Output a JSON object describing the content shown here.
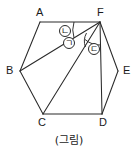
{
  "figure": {
    "caption": "(그림)",
    "shape_name": "hexagon-ABCDEF",
    "stroke_color": "#2a2a2a",
    "background_color": "#ffffff",
    "vertices": [
      {
        "label": "A",
        "x": 40,
        "y": 22,
        "label_x": 36,
        "label_y": 7
      },
      {
        "label": "B",
        "x": 20,
        "y": 71,
        "label_x": 6,
        "label_y": 65
      },
      {
        "label": "C",
        "x": 43,
        "y": 114,
        "label_x": 38,
        "label_y": 117
      },
      {
        "label": "D",
        "x": 102,
        "y": 114,
        "label_x": 99,
        "label_y": 117
      },
      {
        "label": "E",
        "x": 118,
        "y": 71,
        "label_x": 123,
        "label_y": 65
      },
      {
        "label": "F",
        "x": 100,
        "y": 22,
        "label_x": 97,
        "label_y": 7
      }
    ],
    "edges": [
      {
        "name": "edge-AF",
        "from": "A",
        "to": "F"
      },
      {
        "name": "edge-AB",
        "from": "A",
        "to": "B"
      },
      {
        "name": "edge-BC",
        "from": "B",
        "to": "C"
      },
      {
        "name": "edge-CD",
        "from": "C",
        "to": "D"
      },
      {
        "name": "edge-DE",
        "from": "D",
        "to": "E"
      },
      {
        "name": "edge-EF",
        "from": "E",
        "to": "F"
      }
    ],
    "diagonals": [
      {
        "name": "diagonal-FB",
        "from": "F",
        "to": "B"
      },
      {
        "name": "diagonal-FC",
        "from": "F",
        "to": "C"
      },
      {
        "name": "diagonal-FD",
        "from": "F",
        "to": "D"
      }
    ],
    "angle_marks": [
      {
        "name": "angle-giyeok",
        "symbol": "ㄱ",
        "label_x": 63,
        "label_y": 37,
        "radius": 17
      },
      {
        "name": "angle-nieun",
        "symbol": "ㄴ",
        "label_x": 59,
        "label_y": 25,
        "radius": 26
      },
      {
        "name": "angle-digeut",
        "symbol": "ㄷ",
        "label_x": 88,
        "label_y": 43,
        "radius": 23
      }
    ],
    "caption_x": 0,
    "caption_y": 131
  }
}
